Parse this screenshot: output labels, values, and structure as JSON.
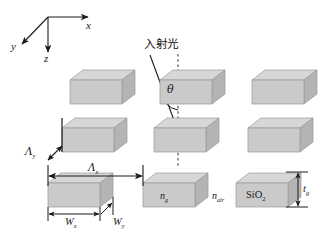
{
  "figure": {
    "title": "",
    "background_color": "#ffffff",
    "width": 319,
    "height": 232
  },
  "axes": {
    "x_label": "x",
    "y_label": "y",
    "z_label": "z",
    "origin": {
      "x": 48,
      "y": 17
    }
  },
  "incident": {
    "text": "入射光",
    "angle_symbol": "θ",
    "normal_style": "dashed-vertical"
  },
  "dimensions": {
    "pitch_y": {
      "symbol": "Λ",
      "subscript": "y"
    },
    "pitch_x": {
      "symbol": "Λ",
      "subscript": "x"
    },
    "width_x": {
      "symbol": "W",
      "subscript": "x"
    },
    "width_y": {
      "symbol": "W",
      "subscript": "y"
    },
    "thickness": {
      "symbol": "t",
      "subscript": "g"
    }
  },
  "materials": {
    "grating_index": {
      "symbol": "n",
      "subscript": "g"
    },
    "air_index": {
      "symbol": "n",
      "subscript": "air"
    },
    "substrate": "SiO",
    "substrate_subscript": "2"
  },
  "blocks": [
    {
      "name": "block-r0-c0",
      "x": 70,
      "y": 72,
      "w": 52,
      "h": 33
    },
    {
      "name": "block-r0-c1",
      "x": 160,
      "y": 72,
      "w": 52,
      "h": 33
    },
    {
      "name": "block-r0-c2",
      "x": 252,
      "y": 72,
      "w": 52,
      "h": 33
    },
    {
      "name": "block-r1-c0",
      "x": 62,
      "y": 120,
      "w": 52,
      "h": 33
    },
    {
      "name": "block-r1-c1",
      "x": 154,
      "y": 120,
      "w": 52,
      "h": 33
    },
    {
      "name": "block-r1-c2",
      "x": 248,
      "y": 120,
      "w": 52,
      "h": 33
    },
    {
      "name": "block-r2-c0",
      "x": 48,
      "y": 175,
      "w": 52,
      "h": 33
    },
    {
      "name": "block-r2-c1",
      "x": 143,
      "y": 175,
      "w": 52,
      "h": 33
    },
    {
      "name": "block-r2-c2",
      "x": 236,
      "y": 175,
      "w": 52,
      "h": 33
    }
  ],
  "colors": {
    "block_front": "#c9c9c9",
    "block_top": "#d7d7d7",
    "block_side": "#b4b4b4",
    "block_edge": "#9a9a9a",
    "line": "#1a1a1a"
  }
}
